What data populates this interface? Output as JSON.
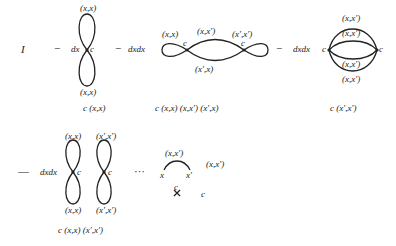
{
  "row1": {
    "identity": "I",
    "minus1": "−",
    "term1": {
      "measure": "dx",
      "vertex": "c",
      "top": "(x,x)",
      "bottom": "(x,x)",
      "factor": "c   (x,x)"
    },
    "minus2": "−",
    "term2": {
      "measure": "dxdx",
      "v1": "c",
      "v2": "c",
      "left_loop": "(x,x)",
      "top": "(x,x′)",
      "right_loop": "(x′,x′)",
      "bottom": "(x′,x)",
      "factor": "c   (x,x)   (x,x′)  (x′,x)"
    },
    "minus3": "−",
    "term3": {
      "measure": "dxdx",
      "v1": "c",
      "v2": "c",
      "labels": [
        "(x,x′)",
        "(x,x′)",
        "(x,x′)",
        "(x,x′)"
      ],
      "factor": "c   (x′,x′)"
    }
  },
  "row2": {
    "minus4": "—",
    "term4": {
      "measure": "dxdx",
      "v1": "c",
      "v2": "c",
      "top1": "(x,x)",
      "bottom1": "(x,x)",
      "top2": "(x′,x′)",
      "bottom2": "(x′,x′)",
      "factor": "c   (x,x)   (x′,x′)"
    },
    "ellipsis": "···",
    "term5": {
      "arc_label": "(x,x′)",
      "left": "x",
      "right": "x′",
      "cross_label": "c",
      "rhs1": "(x,x′)",
      "rhs2": "c"
    }
  }
}
